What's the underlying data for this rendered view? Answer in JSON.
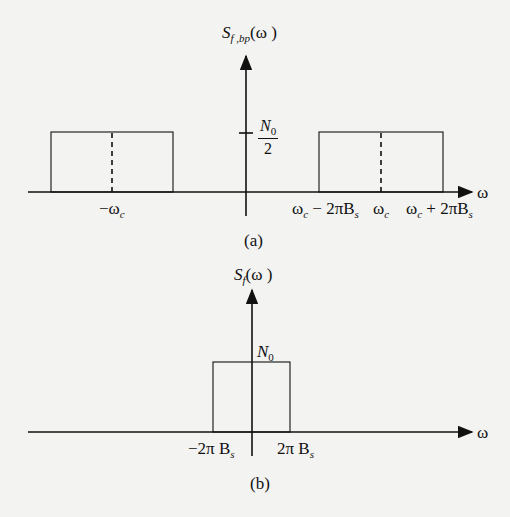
{
  "figure_a": {
    "ylabel_main": "S",
    "ylabel_sub": "f ,bp",
    "ylabel_arg": "(ω )",
    "xlabel": "ω",
    "level_num": "N",
    "level_num_sub": "0",
    "level_den": "2",
    "tick_neg_wc_main": "−ω",
    "tick_neg_wc_sub": "c",
    "tick_low_main": "ω",
    "tick_low_sub": "c",
    "tick_low_rest": " − 2πB",
    "tick_low_rest_sub": "s",
    "tick_wc_main": "ω",
    "tick_wc_sub": "c",
    "tick_high_main": "ω",
    "tick_high_sub": "c",
    "tick_high_rest": " + 2πB",
    "tick_high_rest_sub": "s",
    "caption": "(a)"
  },
  "figure_b": {
    "ylabel_main": "S",
    "ylabel_sub": "f",
    "ylabel_arg": "(ω )",
    "xlabel": "ω",
    "level_main": "N",
    "level_sub": "0",
    "tick_neg_main": "−2π B",
    "tick_neg_sub": "s",
    "tick_pos_main": "2π B",
    "tick_pos_sub": "s",
    "caption": "(b)"
  },
  "colors": {
    "line": "#111111",
    "background": "#f3f3f1"
  }
}
